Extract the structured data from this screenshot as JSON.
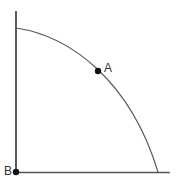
{
  "diagram": {
    "type": "production-possibilities-frontier",
    "points": [
      {
        "label": "A",
        "position": "inside-frontier-near-curve"
      },
      {
        "label": "B",
        "position": "origin"
      }
    ],
    "colors": {
      "axes": "#333333",
      "curve": "#555555",
      "points": "#111111",
      "background": "#ffffff"
    }
  }
}
